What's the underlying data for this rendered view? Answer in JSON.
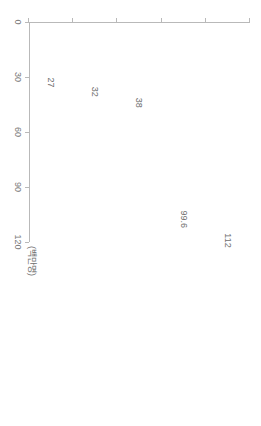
{
  "chart_data": {
    "type": "bar",
    "title": "",
    "subtitle": "",
    "orientation": "vertical-bars-rotated-90",
    "xlabel": "",
    "ylabel": "",
    "unit_label": "(백만명)",
    "categories": [
      "슈퍼볼 결승(2017)",
      "월드컵 결승전(2018)",
      "MLB 월드시리즈(2017)",
      "NBA 파이널(2017)",
      "CS:GO ESL one dogne (2017)"
    ],
    "values": [
      112,
      99.6,
      38,
      32,
      27
    ],
    "value_labels": [
      "112",
      "99.6",
      "38",
      "32",
      "27"
    ],
    "ylim": [
      0,
      120
    ],
    "ticks": [
      0,
      30,
      60,
      90,
      120
    ],
    "tick_labels": [
      "0",
      "30",
      "60",
      "90",
      "120"
    ],
    "grid": false,
    "legend": false,
    "bar_color": "#595959",
    "axis_color": "#b9b9b9",
    "text_color": "#6e6e6e"
  }
}
